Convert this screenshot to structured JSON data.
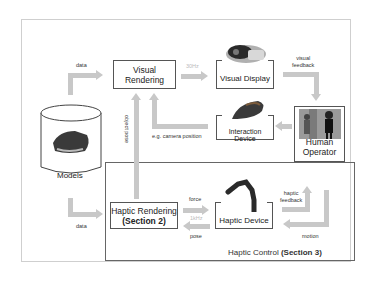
{
  "diagram": {
    "nodes": {
      "visual_rendering": {
        "line1": "Visual",
        "line2": "Rendering"
      },
      "visual_display": {
        "label": "Visual Display"
      },
      "interaction_device": {
        "label": "Interaction Device"
      },
      "human_operator": {
        "line1": "Human",
        "line2": "Operator"
      },
      "models": {
        "label": "Models"
      },
      "haptic_rendering": {
        "line1": "Haptic Rendering",
        "line2": "(Section 2)"
      },
      "haptic_device": {
        "label": "Haptic Device"
      }
    },
    "region": {
      "prefix": "Haptic Control ",
      "bold": "(Section 3)"
    },
    "edges": {
      "data_top": "data",
      "data_bottom": "data",
      "visual_rate": "30Hz",
      "visual_feedback_1": "visual",
      "visual_feedback_2": "feedback",
      "camera_position": "e.g. camera position",
      "object_pose": "object pose",
      "force": "force",
      "haptic_rate": "1kHz",
      "pose": "pose",
      "haptic_feedback_1": "haptic",
      "haptic_feedback_2": "feedback",
      "motion": "motion"
    }
  }
}
